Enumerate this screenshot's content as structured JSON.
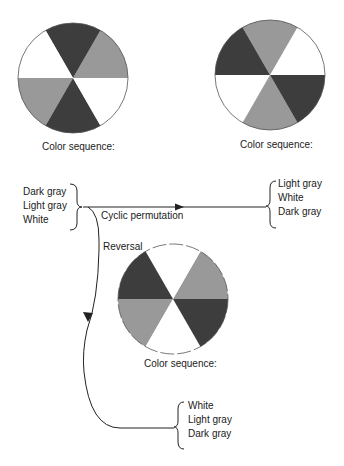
{
  "colors": {
    "dark_gray": "#3d3d3d",
    "light_gray": "#999999",
    "white": "#ffffff",
    "outline": "#555555",
    "line": "#222222"
  },
  "wheels": [
    {
      "id": "wheel-top-left",
      "caption": "Color sequence:",
      "sectors_ccw_from_right": [
        "light_gray",
        "dark_gray",
        "white",
        "light_gray",
        "dark_gray",
        "white"
      ]
    },
    {
      "id": "wheel-top-right",
      "caption": "Color sequence:",
      "sectors_ccw_from_right": [
        "white",
        "light_gray",
        "dark_gray",
        "white",
        "light_gray",
        "dark_gray"
      ]
    },
    {
      "id": "wheel-bottom",
      "caption": "Color sequence:",
      "sectors_ccw_from_right": [
        "light_gray",
        "white",
        "dark_gray",
        "light_gray",
        "white",
        "dark_gray"
      ]
    }
  ],
  "sequences": {
    "original": [
      "Dark gray",
      "Light gray",
      "White"
    ],
    "cyclic": [
      "Light gray",
      "White",
      "Dark gray"
    ],
    "reversed": [
      "White",
      "Light gray",
      "Dark gray"
    ]
  },
  "arrows": {
    "cyclic_label": "Cyclic permutation",
    "reversal_label": "Reversal"
  }
}
